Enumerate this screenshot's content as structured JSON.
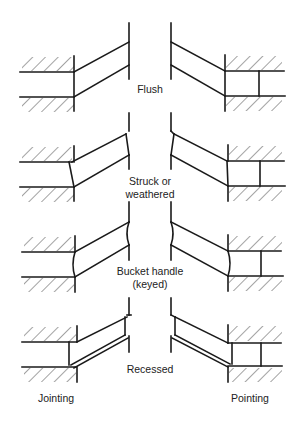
{
  "diagram": {
    "title": "",
    "rows": [
      {
        "id": "flush",
        "label_lines": [
          "Flush"
        ]
      },
      {
        "id": "struck",
        "label_lines": [
          "Struck or",
          "weathered"
        ]
      },
      {
        "id": "bucket",
        "label_lines": [
          "Bucket handle",
          "(keyed)"
        ]
      },
      {
        "id": "recessed",
        "label_lines": [
          "Recessed"
        ]
      }
    ],
    "columns": {
      "left": "Jointing",
      "right": "Pointing"
    },
    "colors": {
      "ink": "#1a1a1a",
      "background": "#ffffff"
    }
  }
}
